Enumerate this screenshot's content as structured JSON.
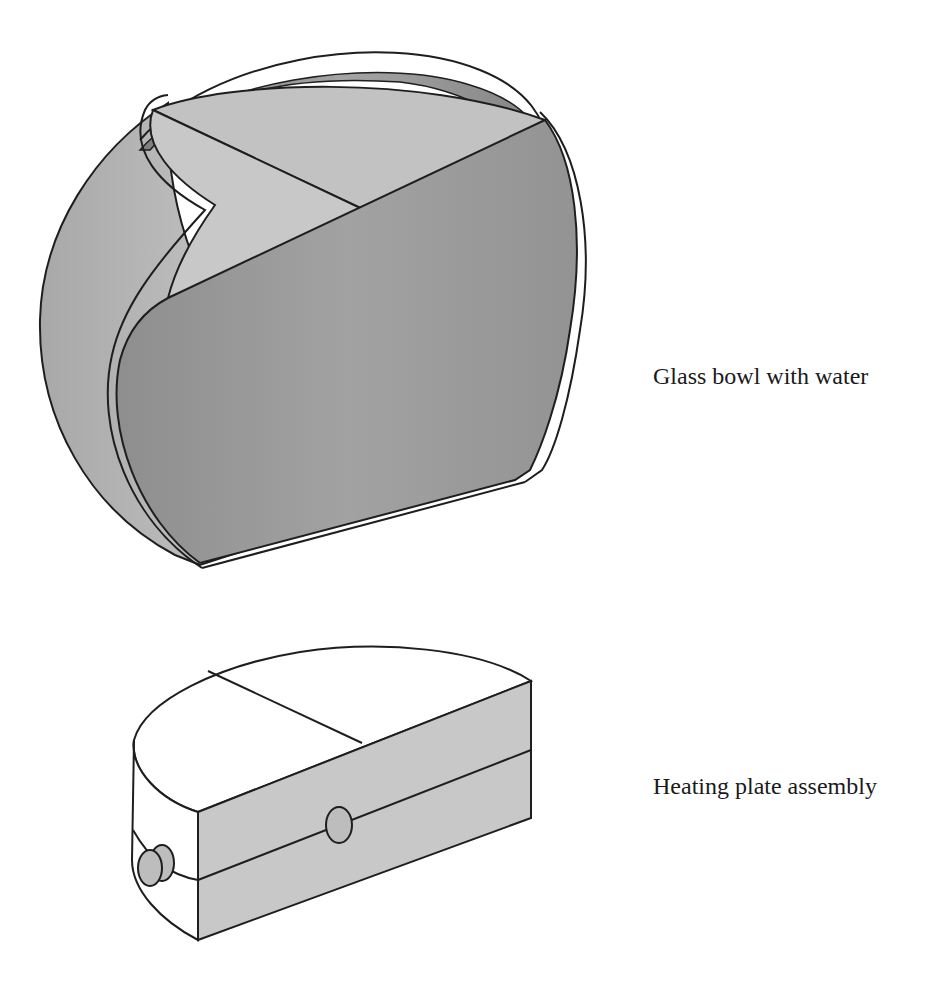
{
  "figure": {
    "components": [
      {
        "id": "glass-bowl",
        "caption": "Glass bowl with water",
        "colors": {
          "outer_shell": "#b4b4b4",
          "water_face": "#9a9a9a",
          "water_top": "#c2c2c2",
          "inner_wall": "#8f8f8f",
          "outline": "#1e1e1e"
        }
      },
      {
        "id": "heating-plate",
        "caption": "Heating plate assembly",
        "colors": {
          "top_face": "#ffffff",
          "front_face": "#c8c8c8",
          "knob": "#bdbdbd",
          "outline": "#1e1e1e"
        }
      }
    ]
  }
}
